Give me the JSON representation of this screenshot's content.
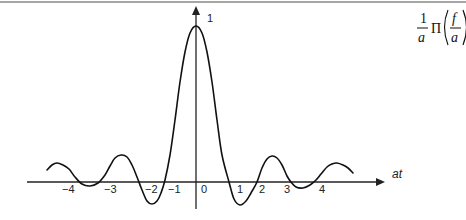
{
  "chart_data": {
    "type": "line",
    "title": "",
    "formula": {
      "numerator": "1",
      "denominator": "a",
      "operator": "Π",
      "arg_numerator": "f",
      "arg_denominator": "a"
    },
    "xlabel": "at",
    "ylabel": "",
    "y_peak_label": "1",
    "x_tick_labels": [
      "−4",
      "−3",
      "−2",
      "−1",
      "0",
      "1",
      "2",
      "3",
      "4"
    ],
    "grid": false,
    "legend": "none",
    "curve_points_px": [
      [
        47,
        170
      ],
      [
        52,
        165
      ],
      [
        57,
        163
      ],
      [
        63,
        165
      ],
      [
        69,
        169
      ],
      [
        75,
        177
      ],
      [
        82,
        184
      ],
      [
        90,
        186
      ],
      [
        98,
        183
      ],
      [
        105,
        175
      ],
      [
        110,
        166
      ],
      [
        115,
        158
      ],
      [
        121,
        155
      ],
      [
        127,
        157
      ],
      [
        132,
        165
      ],
      [
        137,
        177
      ],
      [
        142,
        190
      ],
      [
        147,
        201
      ],
      [
        152,
        204
      ],
      [
        157,
        201
      ],
      [
        161,
        193
      ],
      [
        165,
        180
      ],
      [
        170,
        155
      ],
      [
        175,
        120
      ],
      [
        180,
        82
      ],
      [
        185,
        52
      ],
      [
        190,
        33
      ],
      [
        196,
        26
      ],
      [
        202,
        33
      ],
      [
        207,
        52
      ],
      [
        212,
        82
      ],
      [
        217,
        120
      ],
      [
        222,
        155
      ],
      [
        229,
        182
      ],
      [
        234,
        199
      ],
      [
        240,
        205
      ],
      [
        246,
        201
      ],
      [
        251,
        193
      ],
      [
        257,
        182
      ],
      [
        262,
        168
      ],
      [
        267,
        159
      ],
      [
        272,
        156
      ],
      [
        277,
        158
      ],
      [
        282,
        165
      ],
      [
        287,
        176
      ],
      [
        291,
        182
      ],
      [
        296,
        187
      ],
      [
        303,
        188
      ],
      [
        310,
        185
      ],
      [
        316,
        180
      ],
      [
        321,
        174
      ],
      [
        327,
        167
      ],
      [
        332,
        164
      ],
      [
        337,
        163
      ],
      [
        343,
        165
      ],
      [
        348,
        168
      ],
      [
        353,
        173
      ]
    ]
  },
  "colors": {
    "curve": "#111111",
    "axis": "#222222",
    "border": "#777777",
    "background": "#ffffff"
  }
}
